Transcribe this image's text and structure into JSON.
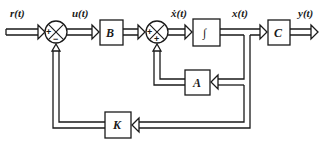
{
  "diagram": {
    "type": "state-feedback block diagram",
    "signals": {
      "input": "r(t)",
      "control": "u(t)",
      "state_derivative": "ẋ(t)",
      "state": "x(t)",
      "output": "y(t)"
    },
    "blocks": {
      "B": "B",
      "integrator": "∫",
      "C": "C",
      "A": "A",
      "K": "K"
    },
    "summing_junctions": [
      {
        "id": "sum1",
        "signs": {
          "left": "+",
          "bottom": "−"
        }
      },
      {
        "id": "sum2",
        "signs": {
          "left": "+",
          "bottom": "+"
        }
      }
    ],
    "connections": [
      "r(t) → sum1 (+)",
      "sum1 → B (u(t))",
      "B → sum2 (+)",
      "sum2 → ∫ (ẋ(t))",
      "∫ → C (x(t))",
      "C → y(t)",
      "x(t) → A → sum2 (+)",
      "x(t) → K → sum1 (−)"
    ]
  }
}
